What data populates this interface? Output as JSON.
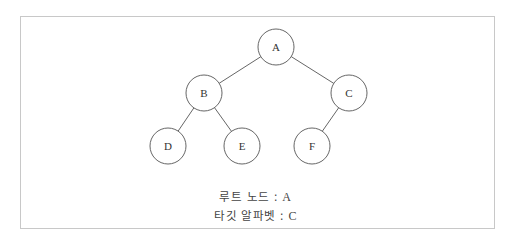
{
  "diagram": {
    "type": "binary-tree",
    "nodes": [
      {
        "id": "A",
        "label": "A",
        "cx": 276,
        "cy": 47
      },
      {
        "id": "B",
        "label": "B",
        "cx": 204,
        "cy": 93
      },
      {
        "id": "C",
        "label": "C",
        "cx": 349,
        "cy": 93
      },
      {
        "id": "D",
        "label": "D",
        "cx": 168,
        "cy": 146
      },
      {
        "id": "E",
        "label": "E",
        "cx": 242,
        "cy": 146
      },
      {
        "id": "F",
        "label": "F",
        "cx": 312,
        "cy": 146
      }
    ],
    "edges": [
      {
        "from": "A",
        "to": "B"
      },
      {
        "from": "A",
        "to": "C"
      },
      {
        "from": "B",
        "to": "D"
      },
      {
        "from": "B",
        "to": "E"
      },
      {
        "from": "C",
        "to": "F"
      }
    ],
    "node_radius": 18,
    "colors": {
      "stroke": "#555555",
      "fill": "#ffffff",
      "frame": "#c8c8c8"
    }
  },
  "captions": {
    "root_label": "루트 노드",
    "root_value": "A",
    "target_label": "타깃 알파벳",
    "target_value": "C",
    "separator": " : "
  }
}
